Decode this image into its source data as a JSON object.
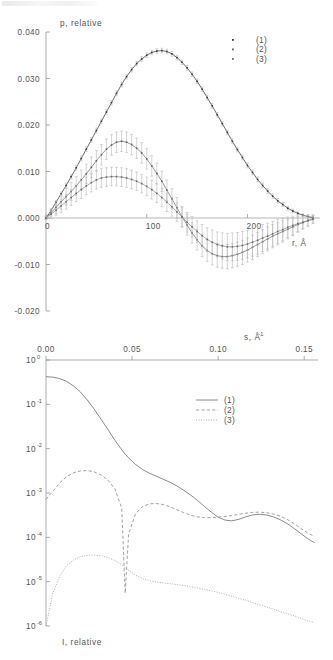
{
  "figure": {
    "artifact_note": "scan-smudge-top-left"
  },
  "chart_data": [
    {
      "id": "top",
      "type": "scatter",
      "title": "",
      "xlabel": "r, Å",
      "ylabel": "p, relative",
      "xlim": [
        0,
        270
      ],
      "ylim": [
        -0.02,
        0.04
      ],
      "xticks": [
        0,
        100,
        200
      ],
      "xticklabels": [
        "0",
        "100",
        "200"
      ],
      "yticks": [
        -0.02,
        -0.01,
        0.0,
        0.01,
        0.02,
        0.03,
        0.04
      ],
      "yticklabels": [
        "-0.020",
        "-0.010",
        "0.000",
        "0.010",
        "0.020",
        "0.030",
        "0.040"
      ],
      "grid": false,
      "errorbars": true,
      "legend_position": "top-right",
      "legend": [
        "(1)",
        "(2)",
        "(3)"
      ],
      "x": [
        0,
        5,
        10,
        15,
        20,
        25,
        30,
        35,
        40,
        45,
        50,
        55,
        60,
        65,
        70,
        75,
        80,
        85,
        90,
        95,
        100,
        105,
        110,
        115,
        120,
        125,
        130,
        135,
        140,
        145,
        150,
        155,
        160,
        165,
        170,
        175,
        180,
        185,
        190,
        195,
        200,
        205,
        210,
        215,
        220,
        225,
        230,
        235,
        240,
        245,
        250,
        255,
        260,
        265
      ],
      "series": [
        {
          "name": "(1)",
          "values": [
            0.0,
            0.0016,
            0.0034,
            0.0052,
            0.007,
            0.0089,
            0.0108,
            0.0128,
            0.0148,
            0.0168,
            0.0188,
            0.0208,
            0.0228,
            0.0248,
            0.0268,
            0.0287,
            0.0304,
            0.0319,
            0.0332,
            0.0342,
            0.035,
            0.0356,
            0.0359,
            0.036,
            0.0358,
            0.0353,
            0.0345,
            0.0335,
            0.0323,
            0.0309,
            0.0294,
            0.0277,
            0.0259,
            0.0241,
            0.0222,
            0.0203,
            0.0184,
            0.0165,
            0.0147,
            0.013,
            0.0113,
            0.0098,
            0.0083,
            0.007,
            0.0058,
            0.0047,
            0.0037,
            0.0029,
            0.0021,
            0.0015,
            0.001,
            0.0006,
            0.0003,
            0.0001
          ],
          "errors": [
            0.0002,
            0.0003,
            0.0004,
            0.0004,
            0.0005,
            0.0005,
            0.0005,
            0.0005,
            0.0005,
            0.0005,
            0.0005,
            0.0005,
            0.0005,
            0.0005,
            0.0005,
            0.0005,
            0.0005,
            0.0005,
            0.0005,
            0.0005,
            0.0005,
            0.0005,
            0.0005,
            0.0005,
            0.0005,
            0.0005,
            0.0005,
            0.0005,
            0.0005,
            0.0005,
            0.0005,
            0.0005,
            0.0005,
            0.0005,
            0.0005,
            0.0005,
            0.0005,
            0.0005,
            0.0005,
            0.0005,
            0.0005,
            0.0005,
            0.0005,
            0.0005,
            0.0005,
            0.0005,
            0.0005,
            0.0004,
            0.0004,
            0.0004,
            0.0003,
            0.0003,
            0.0003,
            0.0003
          ]
        },
        {
          "name": "(2)",
          "values": [
            0.0,
            0.0011,
            0.0023,
            0.0035,
            0.0046,
            0.0057,
            0.0069,
            0.0082,
            0.0095,
            0.0109,
            0.0123,
            0.0136,
            0.0148,
            0.0157,
            0.0163,
            0.0165,
            0.0163,
            0.0158,
            0.015,
            0.014,
            0.0127,
            0.0112,
            0.0096,
            0.0079,
            0.006,
            0.0041,
            0.0022,
            0.0003,
            -0.0015,
            -0.0032,
            -0.0047,
            -0.006,
            -0.007,
            -0.0077,
            -0.0081,
            -0.0083,
            -0.0083,
            -0.0081,
            -0.0078,
            -0.0074,
            -0.0069,
            -0.0063,
            -0.0057,
            -0.0051,
            -0.0045,
            -0.0039,
            -0.0034,
            -0.0029,
            -0.0024,
            -0.0019,
            -0.0014,
            -0.001,
            -0.0006,
            -0.0003
          ],
          "errors": [
            0.0003,
            0.0009,
            0.0013,
            0.0016,
            0.0018,
            0.0019,
            0.002,
            0.0021,
            0.0021,
            0.0022,
            0.0022,
            0.0022,
            0.0022,
            0.0022,
            0.0022,
            0.0022,
            0.0022,
            0.0022,
            0.0022,
            0.0022,
            0.0022,
            0.0022,
            0.0022,
            0.0022,
            0.0022,
            0.0022,
            0.0022,
            0.0022,
            0.0022,
            0.0022,
            0.0022,
            0.0023,
            0.0023,
            0.0024,
            0.0025,
            0.0025,
            0.0026,
            0.0026,
            0.0026,
            0.0026,
            0.0026,
            0.0026,
            0.0026,
            0.0026,
            0.0026,
            0.0025,
            0.0024,
            0.0023,
            0.0021,
            0.0019,
            0.0017,
            0.0014,
            0.0012,
            0.0009
          ]
        },
        {
          "name": "(3)",
          "values": [
            0.0,
            0.0008,
            0.0017,
            0.0026,
            0.0035,
            0.0044,
            0.0053,
            0.0061,
            0.0069,
            0.0076,
            0.0082,
            0.0086,
            0.0088,
            0.0089,
            0.0089,
            0.0088,
            0.0086,
            0.0083,
            0.0079,
            0.0074,
            0.0068,
            0.0061,
            0.0053,
            0.0044,
            0.0034,
            0.0024,
            0.0013,
            0.0002,
            -0.0009,
            -0.0019,
            -0.0029,
            -0.0038,
            -0.0046,
            -0.0052,
            -0.0057,
            -0.006,
            -0.0062,
            -0.0062,
            -0.0061,
            -0.0059,
            -0.0056,
            -0.0052,
            -0.0048,
            -0.0043,
            -0.0039,
            -0.0034,
            -0.0029,
            -0.0025,
            -0.002,
            -0.0016,
            -0.0012,
            -0.0009,
            -0.0005,
            -0.0002
          ],
          "errors": [
            0.0003,
            0.0008,
            0.0011,
            0.0014,
            0.0016,
            0.0017,
            0.0018,
            0.0019,
            0.0019,
            0.002,
            0.002,
            0.002,
            0.002,
            0.002,
            0.002,
            0.002,
            0.002,
            0.002,
            0.002,
            0.002,
            0.002,
            0.002,
            0.002,
            0.002,
            0.002,
            0.002,
            0.002,
            0.0021,
            0.0021,
            0.0022,
            0.0023,
            0.0024,
            0.0025,
            0.0026,
            0.0027,
            0.0028,
            0.0029,
            0.003,
            0.003,
            0.003,
            0.003,
            0.003,
            0.003,
            0.0029,
            0.0028,
            0.0027,
            0.0026,
            0.0024,
            0.0022,
            0.002,
            0.0017,
            0.0014,
            0.0012,
            0.0009
          ]
        }
      ]
    },
    {
      "id": "bottom",
      "type": "line",
      "title": "",
      "xlabel": "s, Å⁻¹",
      "ylabel": "I, relative",
      "xaxis_position": "top",
      "yscale": "log",
      "xlim": [
        0.0,
        0.158
      ],
      "ylim": [
        1e-06,
        1.0
      ],
      "xticks": [
        0.0,
        0.05,
        0.1,
        0.15
      ],
      "xticklabels": [
        "0.00",
        "0.05",
        "0.10",
        "0.15"
      ],
      "yticks": [
        1,
        0.1,
        0.01,
        0.001,
        0.0001,
        1e-05,
        1e-06
      ],
      "yticklabels": [
        "10^0",
        "10^-1",
        "10^-2",
        "10^-3",
        "10^-4",
        "10^-5",
        "10^-6"
      ],
      "grid": false,
      "legend_position": "upper-right",
      "legend": [
        "(1)",
        "(2)",
        "(3)"
      ],
      "x": [
        0.0,
        0.004,
        0.008,
        0.012,
        0.016,
        0.02,
        0.024,
        0.028,
        0.032,
        0.036,
        0.04,
        0.044,
        0.046,
        0.048,
        0.052,
        0.056,
        0.06,
        0.064,
        0.068,
        0.072,
        0.076,
        0.08,
        0.084,
        0.088,
        0.092,
        0.096,
        0.1,
        0.104,
        0.108,
        0.112,
        0.116,
        0.12,
        0.124,
        0.128,
        0.132,
        0.136,
        0.14,
        0.144,
        0.148,
        0.152,
        0.156
      ],
      "series": [
        {
          "name": "(1)",
          "style": "solid",
          "values": [
            0.42,
            0.41,
            0.38,
            0.33,
            0.26,
            0.19,
            0.125,
            0.078,
            0.046,
            0.027,
            0.0155,
            0.0094,
            0.0075,
            0.0062,
            0.0044,
            0.0034,
            0.0028,
            0.0024,
            0.00205,
            0.00175,
            0.00145,
            0.00115,
            0.0009,
            0.00068,
            0.0005,
            0.00037,
            0.000285,
            0.000245,
            0.000235,
            0.000255,
            0.00029,
            0.00032,
            0.00033,
            0.00032,
            0.00029,
            0.00025,
            0.000205,
            0.00016,
            0.000122,
            9.35e-05,
            7.55e-05
          ]
        },
        {
          "name": "(2)",
          "style": "dashed",
          "values": [
            0.00072,
            0.0011,
            0.0017,
            0.00235,
            0.00285,
            0.00315,
            0.0032,
            0.003,
            0.00255,
            0.00195,
            0.00125,
            0.00045,
            5.5e-06,
            0.00012,
            0.00034,
            0.00049,
            0.00057,
            0.00058,
            0.00055,
            0.00049,
            0.00042,
            0.00036,
            0.000315,
            0.00029,
            0.00028,
            0.00028,
            0.000285,
            0.000295,
            0.00031,
            0.00033,
            0.00035,
            0.000365,
            0.00037,
            0.00036,
            0.000335,
            0.0003,
            0.000255,
            0.000205,
            0.00016,
            0.000125,
            0.000105
          ]
        },
        {
          "name": "(3)",
          "style": "dotted",
          "values": [
            1e-06,
            5.5e-06,
            1.35e-05,
            2.3e-05,
            3.1e-05,
            3.65e-05,
            3.95e-05,
            4e-05,
            3.85e-05,
            3.5e-05,
            3e-05,
            2.4e-05,
            2.05e-05,
            1.8e-05,
            1.4e-05,
            1.18e-05,
            1.05e-05,
            9.8e-06,
            9.4e-06,
            9e-06,
            8.6e-06,
            8.2e-06,
            7.7e-06,
            7.2e-06,
            6.7e-06,
            6.2e-06,
            5.7e-06,
            5.2e-06,
            4.7e-06,
            4.2e-06,
            3.8e-06,
            3.4e-06,
            3e-06,
            2.7e-06,
            2.4e-06,
            2.1e-06,
            1.9e-06,
            1.7e-06,
            1.5e-06,
            1.3e-06,
            1.2e-06
          ]
        }
      ]
    }
  ]
}
